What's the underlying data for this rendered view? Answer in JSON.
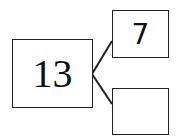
{
  "number_bond": {
    "whole": "13",
    "parts": [
      "7",
      ""
    ]
  },
  "colors": {
    "stroke": "#222222",
    "background": "#ffffff"
  }
}
